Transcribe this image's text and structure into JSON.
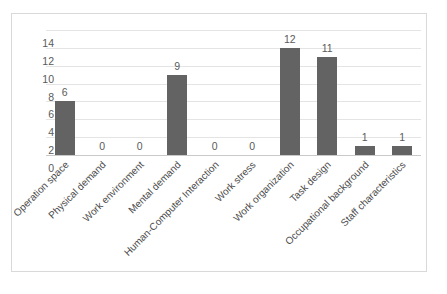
{
  "chart_data": {
    "type": "bar",
    "title": "",
    "subtitle": "",
    "xlabel": "",
    "ylabel": "",
    "ylim": [
      0,
      14
    ],
    "yticks": [
      0,
      2,
      4,
      6,
      8,
      10,
      12,
      14
    ],
    "grid": true,
    "legend": false,
    "legend_position": "none",
    "bar_color": "#636363",
    "gridline_color": "#e4e4e4",
    "border_color": "#d9d9d9",
    "label_color": "#5a5a5a",
    "background": "#ffffff",
    "categories": [
      "Operation space",
      "Physical demand",
      "Work environment",
      "Mental demand",
      "Human-Computer Interaction",
      "Work stress",
      "Work organization",
      "Task design",
      "Occupational background",
      "Staff characteristics"
    ],
    "values": [
      6,
      0,
      0,
      9,
      0,
      0,
      12,
      11,
      1,
      1
    ],
    "data_labels": [
      "6",
      "0",
      "0",
      "9",
      "0",
      "0",
      "12",
      "11",
      "1",
      "1"
    ]
  }
}
